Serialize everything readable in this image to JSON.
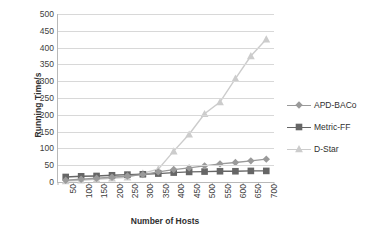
{
  "chart_data": {
    "type": "line",
    "title": "",
    "xlabel": "Number of Hosts",
    "ylabel": "Running Time/s",
    "categories": [
      50,
      100,
      150,
      200,
      250,
      300,
      350,
      400,
      450,
      500,
      550,
      600,
      650,
      700
    ],
    "x_tick_labels": [
      "50",
      "100",
      "150",
      "200",
      "250",
      "300",
      "350",
      "400",
      "450",
      "500",
      "550",
      "600",
      "650",
      "700"
    ],
    "y_tick_labels": [
      "0",
      "50",
      "100",
      "150",
      "200",
      "250",
      "300",
      "350",
      "400",
      "450",
      "500"
    ],
    "ylim": [
      0,
      500
    ],
    "y_tick_step": 50,
    "grid": "horizontal",
    "legend_position": "right",
    "series": [
      {
        "name": "APD-BACo",
        "marker": "diamond",
        "color": "#9a9a9a",
        "values": [
          5,
          8,
          11,
          14,
          18,
          22,
          30,
          37,
          42,
          48,
          54,
          58,
          63,
          68
        ]
      },
      {
        "name": "Metric-FF",
        "marker": "square",
        "color": "#666666",
        "values": [
          15,
          17,
          18,
          20,
          22,
          23,
          25,
          28,
          30,
          31,
          32,
          32,
          33,
          33
        ]
      },
      {
        "name": "D-Star",
        "marker": "triangle",
        "color": "#cccccc",
        "values": [
          3,
          5,
          8,
          11,
          14,
          26,
          38,
          92,
          142,
          203,
          238,
          308,
          375,
          425
        ]
      }
    ]
  },
  "axis": {
    "y_title": "Running Time/s",
    "x_title": "Number of Hosts"
  },
  "colors": {
    "gridline": "#d8d8d8",
    "axis": "#b9b9b9",
    "text": "#2f2f2f",
    "plot_background": "#ffffff"
  }
}
